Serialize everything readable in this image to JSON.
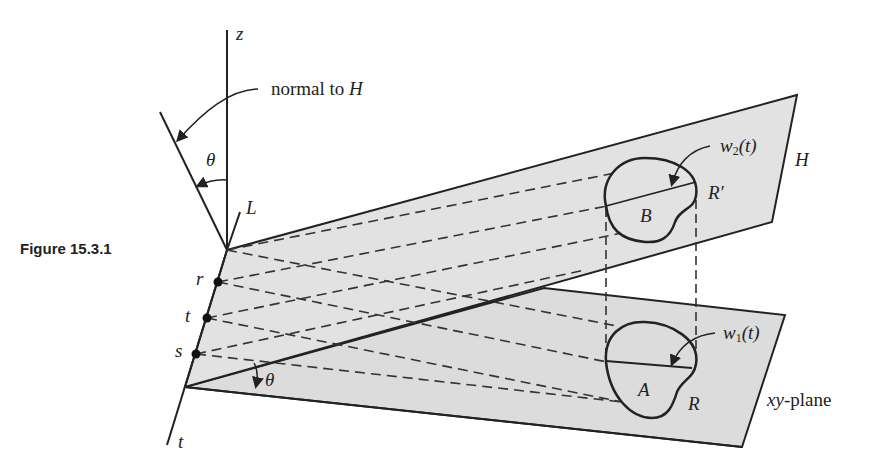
{
  "figure": {
    "caption": "Figure 15.3.1",
    "labels": {
      "z_axis": "z",
      "normal_text": "normal to ",
      "normal_H": "H",
      "theta_top": "θ",
      "theta_bottom": "θ",
      "L": "L",
      "r": "r",
      "t_mid": "t",
      "s": "s",
      "t_bottom": "t",
      "H_plane": "H",
      "B_region": "B",
      "R_prime": "R′",
      "A_region": "A",
      "R": "R",
      "w2_main": "w",
      "w2_sub": "2",
      "w2_arg": "(t)",
      "w1_main": "w",
      "w1_sub": "1",
      "w1_arg": "(t)",
      "xy_italic": "xy",
      "xy_rest": "-plane"
    },
    "colors": {
      "plane_fill": "#dcdcdc",
      "stroke": "#222222",
      "background": "#ffffff"
    }
  }
}
